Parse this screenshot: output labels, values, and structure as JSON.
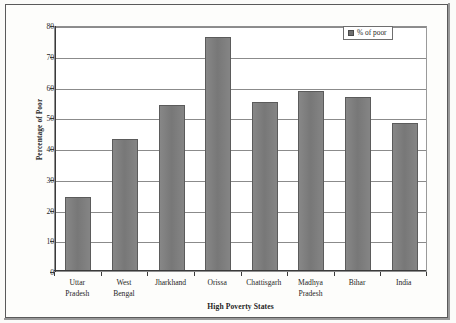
{
  "chart_data": {
    "type": "bar",
    "title": "",
    "xlabel": "High Poverty States",
    "ylabel": "Percentage of Poor",
    "categories": [
      "Uttar Pradesh",
      "West Bengal",
      "Jharkhand",
      "Orissa",
      "Chattisgarh",
      "Madhya Pradesh",
      "Bihar",
      "India"
    ],
    "category_lines": [
      [
        "Uttar",
        "Pradesh"
      ],
      [
        "West",
        "Bengal"
      ],
      [
        "Jharkhand",
        ""
      ],
      [
        "Orissa",
        ""
      ],
      [
        "Chattisgarh",
        ""
      ],
      [
        "Madhya",
        "Pradesh"
      ],
      [
        "Bihar",
        ""
      ],
      [
        "India",
        ""
      ]
    ],
    "values": [
      24,
      43,
      54,
      76,
      55,
      58.5,
      56.5,
      48
    ],
    "series": [
      {
        "name": "% of poor",
        "values": [
          24,
          43,
          54,
          76,
          55,
          58.5,
          56.5,
          48
        ]
      }
    ],
    "ylim": [
      0,
      80
    ],
    "yticks": [
      0,
      10,
      20,
      30,
      40,
      50,
      60,
      70,
      80
    ],
    "ytick_labels": [
      "0",
      "10",
      "20",
      "30",
      "40",
      "50",
      "60",
      "70",
      "80"
    ],
    "grid": "horizontal",
    "legend": {
      "position": "top-right",
      "entries": [
        {
          "label": "% of poor",
          "color": "#7e7e7e"
        }
      ]
    },
    "colors": {
      "bar_fill": "#7e7e7e",
      "bar_border": "#5b5b5b",
      "gridline": "#8b8b8b",
      "axis": "#3a3a3a",
      "plot_background": "#ffffff",
      "page_background": "#fdfdfb"
    }
  }
}
